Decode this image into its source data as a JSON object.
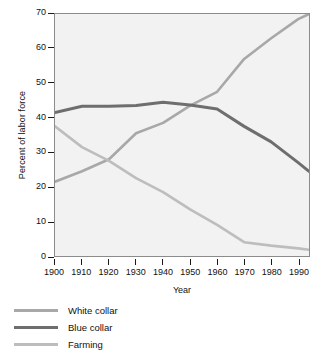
{
  "chart_data": {
    "type": "line",
    "title": "",
    "xlabel": "Year",
    "ylabel": "Percent of labor force",
    "xlim": [
      1900,
      1994
    ],
    "ylim": [
      0,
      70
    ],
    "grid": false,
    "legend_position": "below",
    "xticks": [
      1900,
      1910,
      1920,
      1930,
      1940,
      1950,
      1960,
      1970,
      1980,
      1990
    ],
    "yticks": [
      0,
      10,
      20,
      30,
      40,
      50,
      60,
      70
    ],
    "x": [
      1900,
      1910,
      1920,
      1930,
      1940,
      1950,
      1960,
      1970,
      1980,
      1990,
      1994
    ],
    "series": [
      {
        "name": "White collar",
        "color": "#a8a8a8",
        "values": [
          21.5,
          24.5,
          28.0,
          35.5,
          38.5,
          43.5,
          47.5,
          57.0,
          63.0,
          68.5,
          70.0
        ]
      },
      {
        "name": "Blue collar",
        "color": "#6e6e6e",
        "values": [
          41.5,
          43.3,
          43.3,
          43.5,
          44.5,
          43.7,
          42.5,
          37.5,
          33.0,
          27.0,
          24.5
        ]
      },
      {
        "name": "Farming",
        "color": "#bdbdbd",
        "values": [
          37.5,
          31.5,
          27.5,
          22.5,
          18.5,
          13.5,
          9.0,
          4.0,
          3.0,
          2.2,
          1.8
        ]
      }
    ]
  },
  "legend": {
    "items": [
      {
        "label": "White collar",
        "color": "#a8a8a8"
      },
      {
        "label": "Blue collar",
        "color": "#6e6e6e"
      },
      {
        "label": "Farming",
        "color": "#bdbdbd"
      }
    ]
  },
  "axes": {
    "x_title": "Year",
    "y_title": "Percent of labor force"
  },
  "colors": {
    "plot_background": "#f2f2f2",
    "frame": "#8c8c8c",
    "text": "#111111"
  }
}
